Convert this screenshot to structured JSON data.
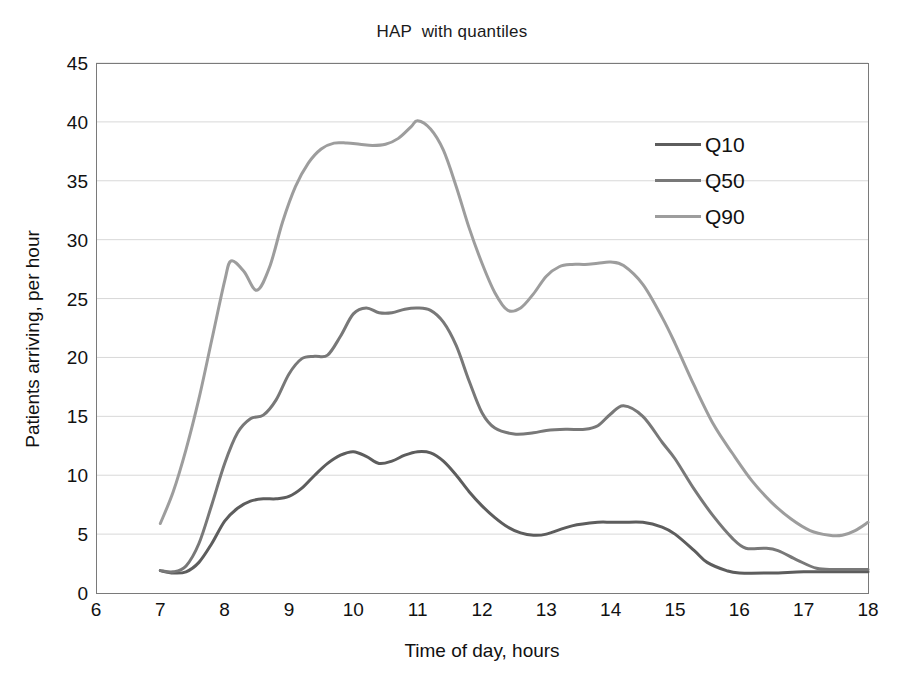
{
  "chart_data": {
    "type": "line",
    "title": "HAP  with quantiles",
    "xlabel": "Time of day, hours",
    "ylabel": "Patients arriving, per hour",
    "xlim": [
      6,
      18
    ],
    "ylim": [
      0,
      45
    ],
    "xticks": [
      "6",
      "7",
      "8",
      "9",
      "10",
      "11",
      "12",
      "13",
      "14",
      "15",
      "16",
      "17",
      "18"
    ],
    "yticks": [
      "0",
      "5",
      "10",
      "15",
      "20",
      "25",
      "30",
      "35",
      "40",
      "45"
    ],
    "grid": "horizontal",
    "legend_position": "upper-right",
    "series": [
      {
        "name": "Q10",
        "color": "#5d5d5d",
        "x": [
          7.0,
          7.2,
          7.4,
          7.6,
          7.8,
          8.0,
          8.2,
          8.4,
          8.6,
          8.8,
          9.0,
          9.2,
          9.4,
          9.6,
          9.8,
          10.0,
          10.2,
          10.4,
          10.6,
          10.8,
          11.0,
          11.2,
          11.4,
          11.6,
          11.8,
          12.0,
          12.2,
          12.4,
          12.6,
          12.8,
          13.0,
          13.4,
          13.8,
          14.0,
          14.2,
          14.5,
          14.8,
          15.0,
          15.3,
          15.5,
          15.8,
          16.0,
          16.5,
          17.0,
          17.5,
          18.0
        ],
        "y": [
          1.9,
          1.7,
          1.8,
          2.6,
          4.2,
          6.1,
          7.2,
          7.8,
          8.0,
          8.0,
          8.2,
          8.9,
          10.0,
          11.0,
          11.7,
          12.0,
          11.6,
          11.0,
          11.2,
          11.7,
          12.0,
          11.9,
          11.2,
          10.0,
          8.6,
          7.4,
          6.4,
          5.6,
          5.1,
          4.9,
          5.0,
          5.7,
          6.0,
          6.0,
          6.0,
          6.0,
          5.6,
          5.0,
          3.6,
          2.6,
          1.9,
          1.7,
          1.7,
          1.8,
          1.8,
          1.8
        ]
      },
      {
        "name": "Q50",
        "color": "#787878",
        "x": [
          7.0,
          7.2,
          7.4,
          7.6,
          7.8,
          8.0,
          8.2,
          8.4,
          8.6,
          8.8,
          9.0,
          9.2,
          9.4,
          9.6,
          9.8,
          10.0,
          10.2,
          10.4,
          10.6,
          10.8,
          11.0,
          11.2,
          11.4,
          11.6,
          11.8,
          12.0,
          12.2,
          12.5,
          12.8,
          13.0,
          13.3,
          13.6,
          13.8,
          14.0,
          14.2,
          14.5,
          14.8,
          15.0,
          15.3,
          15.6,
          15.9,
          16.1,
          16.4,
          16.6,
          16.9,
          17.2,
          17.5,
          18.0
        ],
        "y": [
          1.9,
          1.8,
          2.3,
          4.2,
          7.5,
          11.0,
          13.6,
          14.8,
          15.1,
          16.4,
          18.6,
          19.9,
          20.1,
          20.2,
          21.8,
          23.7,
          24.2,
          23.8,
          23.8,
          24.1,
          24.2,
          24.0,
          23.0,
          21.0,
          18.0,
          15.3,
          14.0,
          13.5,
          13.6,
          13.8,
          13.9,
          13.9,
          14.2,
          15.2,
          15.9,
          15.0,
          12.8,
          11.4,
          8.8,
          6.5,
          4.6,
          3.8,
          3.8,
          3.6,
          2.8,
          2.1,
          2.0,
          2.0
        ]
      },
      {
        "name": "Q90",
        "color": "#9d9d9d",
        "x": [
          7.0,
          7.2,
          7.4,
          7.6,
          7.8,
          8.0,
          8.1,
          8.3,
          8.5,
          8.7,
          8.9,
          9.1,
          9.3,
          9.5,
          9.7,
          9.9,
          10.1,
          10.3,
          10.5,
          10.7,
          10.9,
          11.0,
          11.2,
          11.4,
          11.6,
          11.8,
          12.0,
          12.2,
          12.4,
          12.6,
          12.8,
          13.0,
          13.2,
          13.4,
          13.6,
          13.8,
          14.0,
          14.2,
          14.5,
          14.8,
          15.0,
          15.3,
          15.6,
          15.9,
          16.2,
          16.5,
          16.8,
          17.1,
          17.4,
          17.6,
          17.8,
          18.0
        ],
        "y": [
          5.9,
          8.6,
          12.2,
          16.5,
          21.5,
          26.5,
          28.2,
          27.3,
          25.7,
          27.7,
          31.5,
          34.5,
          36.5,
          37.7,
          38.2,
          38.2,
          38.1,
          38.0,
          38.1,
          38.6,
          39.6,
          40.1,
          39.4,
          37.6,
          34.5,
          31.0,
          28.0,
          25.5,
          24.0,
          24.2,
          25.4,
          26.9,
          27.7,
          27.9,
          27.9,
          28.0,
          28.1,
          27.8,
          26.2,
          23.4,
          21.2,
          17.6,
          14.3,
          11.8,
          9.5,
          7.7,
          6.3,
          5.3,
          4.9,
          4.9,
          5.3,
          6.0
        ]
      }
    ]
  },
  "legend": {
    "items": [
      {
        "label": "Q10"
      },
      {
        "label": "Q50"
      },
      {
        "label": "Q90"
      }
    ]
  }
}
